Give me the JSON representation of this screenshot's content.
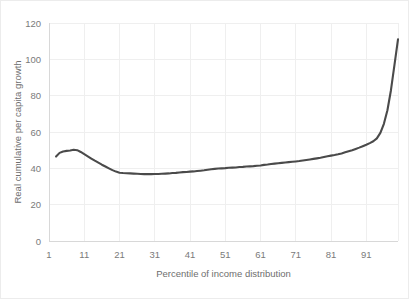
{
  "chart_data": {
    "type": "line",
    "title": "",
    "subtitle": "",
    "xlabel": "Percentile of income distribution",
    "ylabel": "Real cumulative per capita growth",
    "xlim": [
      1,
      100
    ],
    "ylim": [
      0,
      120
    ],
    "xticks": [
      1,
      11,
      21,
      31,
      41,
      51,
      61,
      71,
      81,
      91
    ],
    "xtick_labels": [
      "1",
      "11",
      "21",
      "31",
      "41",
      "51",
      "61",
      "71",
      "81",
      "91"
    ],
    "yticks": [
      0,
      20,
      40,
      60,
      80,
      100,
      120
    ],
    "ytick_labels": [
      "0",
      "20",
      "40",
      "60",
      "80",
      "100",
      "120"
    ],
    "grid": true,
    "grid_axis": "both",
    "legend": false,
    "legend_position": "none",
    "line_color": "#4a4a4a",
    "grid_color": "#efefef",
    "tick_label_color": "#7a7a7a",
    "axis_title_color": "#6e6e6e",
    "background_color": "#ffffff",
    "series": [
      {
        "name": "Real cumulative per capita growth",
        "x": [
          3,
          4,
          5,
          6,
          7,
          8,
          9,
          10,
          11,
          12,
          13,
          14,
          15,
          16,
          17,
          18,
          19,
          20,
          21,
          22,
          23,
          24,
          25,
          26,
          27,
          28,
          29,
          30,
          31,
          32,
          33,
          34,
          35,
          36,
          37,
          38,
          39,
          40,
          41,
          42,
          43,
          44,
          45,
          46,
          47,
          48,
          49,
          50,
          51,
          52,
          53,
          54,
          55,
          56,
          57,
          58,
          59,
          60,
          61,
          62,
          63,
          64,
          65,
          66,
          67,
          68,
          69,
          70,
          71,
          72,
          73,
          74,
          75,
          76,
          77,
          78,
          79,
          80,
          81,
          82,
          83,
          84,
          85,
          86,
          87,
          88,
          89,
          90,
          91,
          92,
          93,
          94,
          95,
          96,
          97,
          98,
          99,
          100
        ],
        "values": [
          46.5,
          48.5,
          49.3,
          49.6,
          49.8,
          50.2,
          50.0,
          49.0,
          47.8,
          46.6,
          45.4,
          44.2,
          43.1,
          42.0,
          41.0,
          40.0,
          39.0,
          38.2,
          37.6,
          37.4,
          37.3,
          37.2,
          37.1,
          37.0,
          36.9,
          36.8,
          36.8,
          36.8,
          36.9,
          36.9,
          37.0,
          37.1,
          37.2,
          37.4,
          37.5,
          37.7,
          37.9,
          38.0,
          38.2,
          38.3,
          38.5,
          38.7,
          38.9,
          39.2,
          39.5,
          39.7,
          39.9,
          40.0,
          40.1,
          40.3,
          40.4,
          40.5,
          40.7,
          40.8,
          41.0,
          41.1,
          41.2,
          41.4,
          41.6,
          41.9,
          42.1,
          42.4,
          42.6,
          42.8,
          43.0,
          43.2,
          43.4,
          43.6,
          43.8,
          44.0,
          44.3,
          44.6,
          44.9,
          45.2,
          45.5,
          45.8,
          46.2,
          46.6,
          47.0,
          47.3,
          47.7,
          48.2,
          48.8,
          49.4,
          50.0,
          50.7,
          51.4,
          52.2,
          53.0,
          53.9,
          54.9,
          56.5,
          59.5,
          64.5,
          72.0,
          83.0,
          97.0,
          111.0
        ]
      }
    ],
    "annotations": []
  }
}
